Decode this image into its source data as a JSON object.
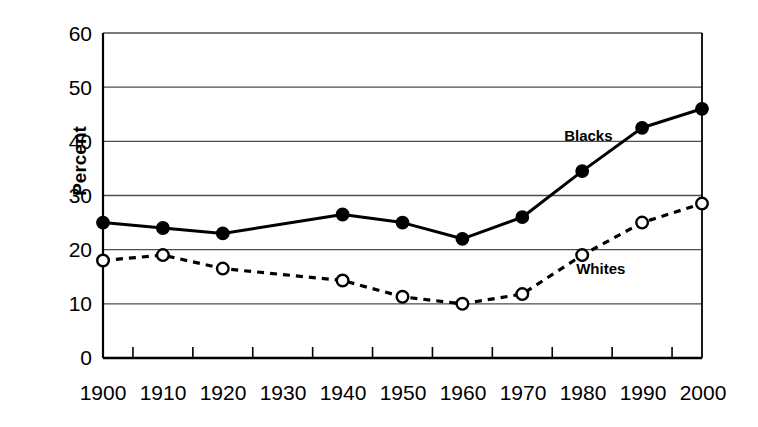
{
  "chart_data": {
    "type": "line",
    "title": "",
    "xlabel": "",
    "ylabel": "Percent",
    "categories": [
      "1900",
      "1910",
      "1920",
      "1930",
      "1940",
      "1950",
      "1960",
      "1970",
      "1980",
      "1990",
      "2000"
    ],
    "x": [
      1900,
      1910,
      1920,
      1930,
      1940,
      1950,
      1960,
      1970,
      1980,
      1990,
      2000
    ],
    "xlim": [
      1900,
      2000
    ],
    "ylim": [
      0,
      60
    ],
    "yticks": [
      0,
      10,
      20,
      30,
      40,
      50,
      60
    ],
    "ytick_labels": [
      "0",
      "10",
      "20",
      "30",
      "40",
      "50",
      "60"
    ],
    "grid": "horizontal",
    "legend": "inline-annotations",
    "series": [
      {
        "name": "Blacks",
        "marker": "filled-circle",
        "line_style": "solid",
        "color": "#000000",
        "values": [
          25,
          24,
          23,
          null,
          26.5,
          25,
          22,
          26,
          34.5,
          42.5,
          46
        ],
        "plotted_x": [
          1900,
          1910,
          1920,
          1940,
          1950,
          1960,
          1970,
          1980,
          1990,
          2000
        ],
        "plotted_values": [
          25,
          24,
          23,
          26.5,
          25,
          22,
          26,
          34.5,
          42.5,
          46
        ]
      },
      {
        "name": "Whites",
        "marker": "open-circle",
        "line_style": "dashed",
        "color": "#000000",
        "values": [
          18,
          19,
          16.5,
          null,
          14.3,
          11.3,
          10,
          11.8,
          19,
          25,
          28.5
        ],
        "plotted_x": [
          1900,
          1910,
          1920,
          1940,
          1950,
          1960,
          1970,
          1980,
          1990,
          2000
        ],
        "plotted_values": [
          18,
          19,
          16.5,
          14.3,
          11.3,
          10,
          11.8,
          19,
          25,
          28.5
        ]
      }
    ],
    "annotations": [
      {
        "text": "Blacks",
        "x": 1980,
        "y": 41
      },
      {
        "text": "Whites",
        "x": 1982,
        "y": 16.5
      }
    ]
  },
  "axes": {
    "y_axis_title": "Percent",
    "y_tick_0": "0",
    "y_tick_10": "10",
    "y_tick_20": "20",
    "y_tick_30": "30",
    "y_tick_40": "40",
    "y_tick_50": "50",
    "y_tick_60": "60",
    "x_tick_1900": "1900",
    "x_tick_1910": "1910",
    "x_tick_1920": "1920",
    "x_tick_1930": "1930",
    "x_tick_1940": "1940",
    "x_tick_1950": "1950",
    "x_tick_1960": "1960",
    "x_tick_1970": "1970",
    "x_tick_1980": "1980",
    "x_tick_1990": "1990",
    "x_tick_2000": "2000"
  },
  "labels": {
    "blacks": "Blacks",
    "whites": "Whites"
  },
  "colors": {
    "ink": "#000000",
    "grid": "#4d4d4d",
    "background": "#ffffff"
  }
}
